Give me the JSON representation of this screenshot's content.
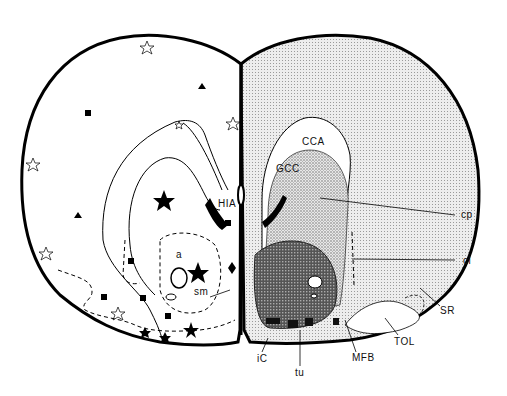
{
  "diagram": {
    "type": "coronal brain section (two hemispheres)",
    "left_hemisphere": {
      "fill": "#ffffff",
      "labels": {
        "hia": "HIA",
        "a": "a",
        "sm": "sm",
        "ic": "iC",
        "tu": "tu"
      },
      "symbols": [
        "filled-star",
        "open-star",
        "filled-square",
        "filled-triangle",
        "filled-diamond"
      ]
    },
    "right_hemisphere": {
      "fill": "#d9d9d9",
      "labels": {
        "cca": "CCA",
        "gcc": "GCC",
        "cp": "cp",
        "cl": "cl",
        "sr": "SR",
        "tol": "TOL",
        "mfb": "MFB"
      }
    },
    "colors": {
      "outline": "#000000",
      "light_shade": "#dcdcdc",
      "stipple": "#c8c8c8",
      "dark_shade": "#6e6e6e",
      "background": "#ffffff"
    }
  }
}
